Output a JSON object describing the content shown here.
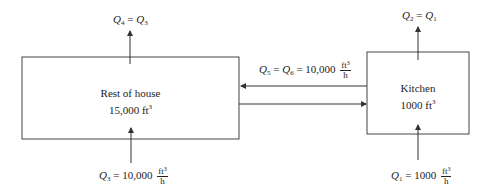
{
  "diagram": {
    "type": "flow-diagram",
    "nodes": [
      {
        "id": "rest",
        "name": "Rest of house",
        "volume": "15,000 ft",
        "volume_exp": "3"
      },
      {
        "id": "kitchen",
        "name": "Kitchen",
        "volume": "1000 ft",
        "volume_exp": "3"
      }
    ],
    "flows": {
      "q4": {
        "lhs": "Q",
        "lhs_sub": "4",
        "eq": " = ",
        "rhs": "Q",
        "rhs_sub": "3"
      },
      "q2": {
        "lhs": "Q",
        "lhs_sub": "2",
        "eq": " = ",
        "rhs": "Q",
        "rhs_sub": "1"
      },
      "q5": {
        "a": "Q",
        "a_sub": "5",
        "eq1": " = ",
        "b": "Q",
        "b_sub": "6",
        "eq2": " = ",
        "value": "10,000",
        "unit_num": "ft",
        "unit_exp": "3",
        "unit_den": "h"
      },
      "q3": {
        "lhs": "Q",
        "lhs_sub": "3",
        "eq": " = ",
        "value": "10,000",
        "unit_num": "ft",
        "unit_exp": "3",
        "unit_den": "h"
      },
      "q1": {
        "lhs": "Q",
        "lhs_sub": "1",
        "eq": " = ",
        "value": "1000",
        "unit_num": "ft",
        "unit_exp": "3",
        "unit_den": "h"
      }
    },
    "colors": {
      "line": "#333333",
      "background": "#ffffff"
    }
  }
}
